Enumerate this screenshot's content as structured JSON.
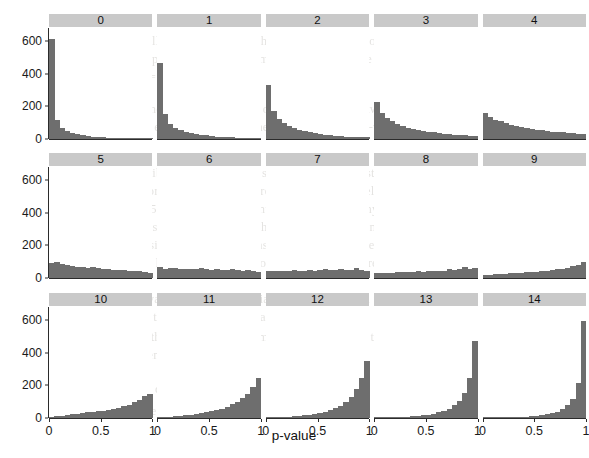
{
  "chart_data": {
    "type": "bar",
    "title": "",
    "subtitle": "",
    "xlabel": "p-value",
    "ylabel": "",
    "xlim": [
      0,
      1
    ],
    "ylim": [
      0,
      680
    ],
    "grid": false,
    "legend": "none",
    "facet_layout": {
      "rows": 3,
      "cols": 5
    },
    "x_ticks": [
      0,
      0.5,
      1
    ],
    "x_tick_labels": [
      "0",
      "0.5",
      "1"
    ],
    "y_ticks": [
      0,
      200,
      400,
      600
    ],
    "y_tick_labels": [
      "0",
      "200",
      "400",
      "600"
    ],
    "bin_centers": [
      0.025,
      0.075,
      0.125,
      0.175,
      0.225,
      0.275,
      0.325,
      0.375,
      0.425,
      0.475,
      0.525,
      0.575,
      0.625,
      0.675,
      0.725,
      0.775,
      0.825,
      0.875,
      0.925,
      0.975
    ],
    "bin_width": 0.05,
    "bar_color": "#6e6e6e",
    "strip_color": "#c9c9c9",
    "panels": [
      {
        "label": "0",
        "values": [
          615,
          118,
          70,
          52,
          38,
          30,
          24,
          18,
          15,
          12,
          10,
          9,
          8,
          6,
          6,
          5,
          4,
          4,
          3,
          3
        ]
      },
      {
        "label": "1",
        "values": [
          465,
          155,
          95,
          70,
          58,
          45,
          38,
          30,
          26,
          22,
          18,
          15,
          13,
          11,
          10,
          8,
          7,
          6,
          5,
          5
        ]
      },
      {
        "label": "2",
        "values": [
          330,
          170,
          122,
          98,
          80,
          66,
          56,
          48,
          42,
          35,
          30,
          26,
          22,
          19,
          17,
          15,
          13,
          12,
          10,
          14
        ]
      },
      {
        "label": "3",
        "values": [
          228,
          160,
          128,
          108,
          92,
          80,
          70,
          62,
          55,
          48,
          44,
          40,
          36,
          33,
          30,
          27,
          25,
          22,
          20,
          18
        ]
      },
      {
        "label": "4",
        "values": [
          160,
          132,
          118,
          108,
          96,
          88,
          80,
          74,
          68,
          62,
          58,
          54,
          50,
          46,
          43,
          40,
          38,
          35,
          33,
          30
        ]
      },
      {
        "label": "5",
        "values": [
          92,
          98,
          88,
          80,
          76,
          70,
          66,
          62,
          66,
          60,
          56,
          58,
          52,
          48,
          50,
          44,
          40,
          46,
          36,
          30
        ]
      },
      {
        "label": "6",
        "values": [
          70,
          56,
          62,
          60,
          58,
          58,
          56,
          55,
          60,
          54,
          52,
          56,
          52,
          50,
          58,
          50,
          46,
          52,
          42,
          36
        ]
      },
      {
        "label": "7",
        "values": [
          44,
          40,
          46,
          42,
          44,
          48,
          44,
          46,
          52,
          46,
          48,
          54,
          50,
          48,
          58,
          52,
          50,
          60,
          52,
          46
        ]
      },
      {
        "label": "8",
        "values": [
          30,
          28,
          32,
          30,
          34,
          36,
          34,
          38,
          40,
          38,
          42,
          46,
          44,
          46,
          56,
          50,
          54,
          70,
          58,
          62
        ]
      },
      {
        "label": "9",
        "values": [
          18,
          20,
          22,
          22,
          26,
          28,
          28,
          32,
          34,
          34,
          38,
          42,
          44,
          48,
          54,
          56,
          62,
          74,
          80,
          96
        ]
      },
      {
        "label": "10",
        "values": [
          6,
          10,
          14,
          18,
          24,
          26,
          30,
          34,
          38,
          42,
          46,
          52,
          58,
          64,
          72,
          82,
          96,
          112,
          132,
          148
        ]
      },
      {
        "label": "11",
        "values": [
          4,
          6,
          8,
          10,
          14,
          16,
          20,
          24,
          28,
          34,
          40,
          48,
          58,
          68,
          84,
          100,
          124,
          150,
          192,
          248
        ]
      },
      {
        "label": "12",
        "values": [
          2,
          3,
          4,
          6,
          8,
          10,
          12,
          16,
          20,
          24,
          30,
          38,
          48,
          60,
          76,
          98,
          130,
          176,
          248,
          352
        ]
      },
      {
        "label": "13",
        "values": [
          2,
          2,
          3,
          4,
          5,
          6,
          8,
          10,
          13,
          17,
          21,
          27,
          34,
          44,
          58,
          78,
          106,
          152,
          244,
          472
        ]
      },
      {
        "label": "14",
        "values": [
          1,
          1,
          2,
          2,
          3,
          4,
          5,
          6,
          8,
          10,
          13,
          17,
          22,
          29,
          39,
          54,
          78,
          118,
          216,
          592
        ]
      }
    ]
  },
  "background_text": {
    "lines": [
      {
        "text": "When the null hypothesis is true the p-value has a uniform distribution,",
        "x": 86,
        "y": 34,
        "size": 12.5,
        "italic": false
      },
      {
        "text": "and so the p-value tends to be small. The sample size is also relevant,",
        "x": 96,
        "y": 52,
        "size": 12.5,
        "italic": false
      },
      {
        "text": "tests with n = 20 samples.",
        "x": 86,
        "y": 70,
        "size": 12.5,
        "italic": false
      },
      {
        "text": "Figure 1.1 shows the distribution of the p-value for a two-sample t-test",
        "x": 88,
        "y": 102,
        "size": 12.5,
        "italic": false
      },
      {
        "text": "with different effect sizes. When there is no effect the p-values follow a",
        "x": 80,
        "y": 120,
        "size": 12.5,
        "italic": false
      },
      {
        "text": "uniform distribution; as the effect size increases the distribution becomes",
        "x": 84,
        "y": 166,
        "size": 12.5,
        "italic": false
      },
      {
        "text": "more and more skewed toward zero, and multiple panels show this.",
        "x": 86,
        "y": 184,
        "size": 12.5,
        "italic": false
      },
      {
        "text": "the usual 0.05 value, at which point we reject the null hypothesis; the value",
        "x": 84,
        "y": 202,
        "size": 12.5,
        "italic": false
      },
      {
        "text": "therefore gives some indication of how strong the evidence is against the",
        "x": 80,
        "y": 220,
        "size": 12.5,
        "italic": false
      },
      {
        "text": "null hypothesis, but it is not a measure of the size of the effect, probability",
        "x": 84,
        "y": 238,
        "size": 12.5,
        "italic": false
      },
      {
        "text": "that the null hypothesis is true, nor the probability of replication.",
        "x": 90,
        "y": 256,
        "size": 12.5,
        "italic": false
      },
      {
        "text": "Indeed, the p-value is a random variable, and changing a few data points",
        "x": 76,
        "y": 292,
        "size": 12.5,
        "italic": false
      },
      {
        "text": "can change the p-value dramatically.",
        "x": 92,
        "y": 310,
        "size": 12.5,
        "italic": false
      },
      {
        "text": "Where does the p-value come from? Suppose we have two groups",
        "x": 86,
        "y": 330,
        "size": 12.5,
        "italic": false
      },
      {
        "text": "of measurements, and",
        "x": 96,
        "y": 348,
        "size": 12.5,
        "italic": false
      },
      {
        "text": "We can then define a test statistic",
        "x": 88,
        "y": 382,
        "size": 12.5,
        "italic": false
      },
      {
        "text": "and compute",
        "x": 90,
        "y": 404,
        "size": 12.5,
        "italic": false
      }
    ]
  }
}
